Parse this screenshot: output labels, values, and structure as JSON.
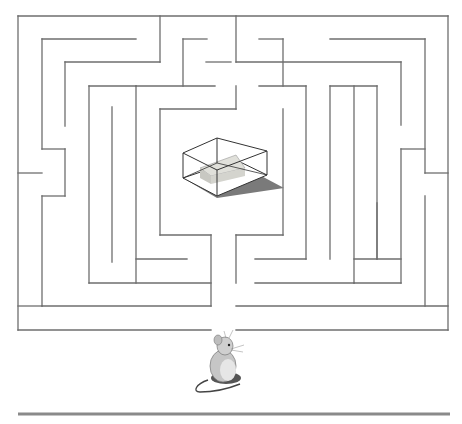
{
  "puzzle": {
    "type": "maze",
    "goal": "cheese-in-glass-box",
    "player": "mouse",
    "entrance": {
      "x1": 211,
      "x2": 236,
      "y": 330
    },
    "colors": {
      "wall": "#6e6e6e",
      "floor_line": "#8a8a8a",
      "box_edge": "#333333",
      "box_shadow": "#7a7a7a",
      "cheese": "#d9d9d2",
      "mouse_body": "#c9c9c9",
      "mouse_dark": "#555555"
    }
  },
  "walls": [
    [
      18,
      16,
      448,
      16
    ],
    [
      18,
      16,
      18,
      330
    ],
    [
      448,
      16,
      448,
      330
    ],
    [
      18,
      330,
      211,
      330
    ],
    [
      236,
      330,
      448,
      330
    ],
    [
      42,
      39,
      136,
      39
    ],
    [
      42,
      39,
      42,
      149
    ],
    [
      42,
      149,
      65,
      149
    ],
    [
      65,
      149,
      65,
      196
    ],
    [
      18,
      173,
      42,
      173
    ],
    [
      42,
      196,
      65,
      196
    ],
    [
      42,
      196,
      42,
      306
    ],
    [
      42,
      306,
      211,
      306
    ],
    [
      160,
      16,
      160,
      62
    ],
    [
      65,
      62,
      160,
      62
    ],
    [
      65,
      62,
      65,
      126
    ],
    [
      89,
      86,
      136,
      86
    ],
    [
      89,
      86,
      89,
      283
    ],
    [
      89,
      283,
      211,
      283
    ],
    [
      112,
      107,
      112,
      262
    ],
    [
      136,
      86,
      136,
      283
    ],
    [
      136,
      86,
      215,
      86
    ],
    [
      183,
      39,
      183,
      86
    ],
    [
      183,
      39,
      207,
      39
    ],
    [
      206,
      62,
      231,
      62
    ],
    [
      160,
      109,
      236,
      109
    ],
    [
      236,
      86,
      236,
      109
    ],
    [
      160,
      109,
      160,
      235
    ],
    [
      160,
      235,
      211,
      235
    ],
    [
      211,
      235,
      211,
      306
    ],
    [
      136,
      259,
      187,
      259
    ],
    [
      236,
      16,
      236,
      62
    ],
    [
      236,
      62,
      401,
      62
    ],
    [
      401,
      62,
      401,
      125
    ],
    [
      330,
      39,
      425,
      39
    ],
    [
      425,
      39,
      425,
      173
    ],
    [
      401,
      149,
      425,
      149
    ],
    [
      401,
      149,
      401,
      283
    ],
    [
      354,
      283,
      401,
      283
    ],
    [
      425,
      173,
      448,
      173
    ],
    [
      425,
      196,
      425,
      306
    ],
    [
      259,
      39,
      283,
      39
    ],
    [
      283,
      39,
      283,
      86
    ],
    [
      259,
      86,
      306,
      86
    ],
    [
      306,
      86,
      306,
      259
    ],
    [
      255,
      259,
      306,
      259
    ],
    [
      283,
      109,
      283,
      235
    ],
    [
      236,
      235,
      283,
      235
    ],
    [
      236,
      235,
      236,
      283
    ],
    [
      330,
      86,
      377,
      86
    ],
    [
      330,
      86,
      330,
      259
    ],
    [
      354,
      86,
      354,
      283
    ],
    [
      377,
      86,
      377,
      259
    ],
    [
      354,
      259,
      401,
      259
    ],
    [
      377,
      203,
      377,
      259
    ],
    [
      236,
      306,
      448,
      306
    ],
    [
      255,
      283,
      354,
      283
    ],
    [
      18,
      306,
      42,
      306
    ]
  ],
  "ground_line": {
    "x1": 18,
    "x2": 450,
    "y": 414
  }
}
